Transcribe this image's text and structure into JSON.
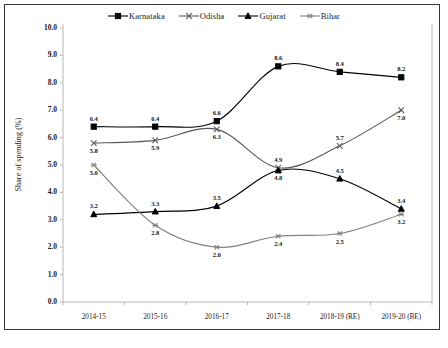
{
  "chart_data": {
    "type": "line",
    "title": "",
    "xlabel": "",
    "ylabel": "Share of spending (%)",
    "categories": [
      "2014-15",
      "2015-16",
      "2016-17",
      "2017-18",
      "2018-19 (RE)",
      "2019-20 (BE)"
    ],
    "ylim": [
      0.0,
      10.0
    ],
    "ytick_labels": [
      "0.0",
      "1.0",
      "2.0",
      "3.0",
      "4.0",
      "5.0",
      "6.0",
      "7.0",
      "8.0",
      "9.0",
      "10.0"
    ],
    "yticks": [
      0.0,
      1.0,
      2.0,
      3.0,
      4.0,
      5.0,
      6.0,
      7.0,
      8.0,
      9.0,
      10.0
    ],
    "grid": false,
    "legend_position": "top-center",
    "series": [
      {
        "name": "Karnataka",
        "marker": "filled-square",
        "color": "#000000",
        "values": [
          6.4,
          6.4,
          6.6,
          8.6,
          8.4,
          8.2
        ],
        "labels": [
          "6.4",
          "6.4",
          "6.6",
          "8.6",
          "8.4",
          "8.2"
        ],
        "label_side": [
          "above",
          "above",
          "above",
          "above",
          "above",
          "above"
        ]
      },
      {
        "name": "Odisha",
        "marker": "cross",
        "color": "#595959",
        "values": [
          5.8,
          5.9,
          6.3,
          4.9,
          5.7,
          7.0
        ],
        "labels": [
          "5.8",
          "5.9",
          "6.3",
          "4.9",
          "5.7",
          "7.0"
        ],
        "label_side": [
          "below",
          "below",
          "below",
          "above",
          "above",
          "below"
        ]
      },
      {
        "name": "Gujarat",
        "marker": "filled-triangle",
        "color": "#000000",
        "values": [
          3.2,
          3.3,
          3.5,
          4.8,
          4.5,
          3.4
        ],
        "labels": [
          "3.2",
          "3.3",
          "3.5",
          "4.8",
          "4.5",
          "3.4"
        ],
        "label_side": [
          "above",
          "above",
          "above",
          "below",
          "above",
          "above"
        ]
      },
      {
        "name": "Bihar",
        "marker": "star",
        "color": "#808080",
        "values": [
          5.0,
          2.8,
          2.0,
          2.4,
          2.5,
          3.2
        ],
        "labels": [
          "5.0",
          "2.8",
          "2.0",
          "2.4",
          "2.5",
          "3.2"
        ],
        "label_side": [
          "below",
          "below",
          "below",
          "below",
          "below",
          "below"
        ]
      }
    ]
  },
  "legend": {
    "entries": [
      {
        "label": "Karnataka"
      },
      {
        "label": "Odisha"
      },
      {
        "label": "Gujarat"
      },
      {
        "label": "Bihar"
      }
    ]
  },
  "caption": ""
}
